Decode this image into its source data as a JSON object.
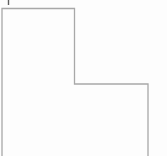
{
  "canvas": {
    "width": 167,
    "height": 156,
    "background": "#fdfdfd"
  },
  "figure": {
    "stroke_color": "#a8a8a8",
    "stroke_width": "1.3",
    "fill": "none",
    "outline_points": "2,156 2,8.5 74.5,8.5 74.5,84 148,84 148,156",
    "corners": {
      "top_left": "2,8.5",
      "top_right_of_upper_arm": "74.5,8.5",
      "inner_step": "74.5,84",
      "outer_right": "148,84"
    },
    "tick": {
      "x1": "8.5",
      "y1": "0",
      "x2": "8.5",
      "y2": "5",
      "color": "#5f5f5f",
      "width": "1.4"
    }
  }
}
